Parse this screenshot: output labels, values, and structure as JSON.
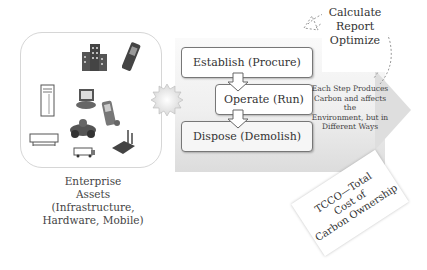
{
  "assets": {
    "caption_lines": [
      "Enterprise",
      "Assets",
      "(Infrastructure,",
      "Hardware, Mobile)"
    ],
    "icons": [
      "building-icon",
      "mobile-phone-icon",
      "server-tower-icon",
      "desktop-computer-icon",
      "pda-icon",
      "printer-icon",
      "car-icon",
      "truck-icon",
      "router-icon"
    ]
  },
  "lifecycle": {
    "steps": [
      {
        "label": "Establish (Procure)"
      },
      {
        "label": "Operate (Run)"
      },
      {
        "label": "Dispose (Demolish)"
      }
    ]
  },
  "actions": {
    "lines": [
      "Calculate",
      "Report",
      "Optimize"
    ]
  },
  "note": {
    "lines": [
      "Each Step Produces",
      "Carbon and affects the",
      "Environment, but in",
      "Different Ways"
    ]
  },
  "tcco": {
    "lines": [
      "TCCO—Total",
      "Cost of",
      "Carbon Ownership"
    ]
  },
  "colors": {
    "panel": "#e6e6e6",
    "border": "#777777",
    "text": "#333333"
  }
}
